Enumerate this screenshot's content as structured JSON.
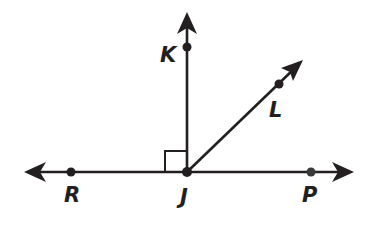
{
  "diagram": {
    "type": "geometry-rays-and-angles",
    "stroke_color": "#231f20",
    "background": "#ffffff",
    "vertex": {
      "name": "J",
      "x": 187,
      "y": 172
    },
    "points": [
      {
        "id": "K",
        "label": "K",
        "x": 187,
        "y": 47
      },
      {
        "id": "L",
        "label": "L",
        "x": 279,
        "y": 84
      },
      {
        "id": "R",
        "label": "R",
        "x": 71,
        "y": 172
      },
      {
        "id": "J",
        "label": "J",
        "x": 187,
        "y": 172
      },
      {
        "id": "P",
        "label": "P",
        "x": 311,
        "y": 172
      }
    ],
    "line": {
      "name": "line RP",
      "from": [
        24,
        172
      ],
      "to": [
        354,
        172
      ],
      "arrows": "both"
    },
    "rays": [
      {
        "name": "ray JK",
        "from": [
          187,
          172
        ],
        "to": [
          187,
          12
        ]
      },
      {
        "name": "ray JL",
        "from": [
          187,
          172
        ],
        "to": [
          303,
          60
        ]
      }
    ],
    "right_angle_marker": {
      "at": "J",
      "between": [
        "JK",
        "JR"
      ],
      "size": 22
    }
  },
  "labels": {
    "K": "K",
    "L": "L",
    "R": "R",
    "J": "J",
    "P": "P"
  }
}
